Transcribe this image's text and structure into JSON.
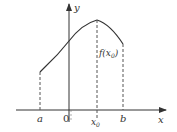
{
  "diagram": {
    "type": "function-graph",
    "axes": {
      "x_label": "x",
      "y_label": "y",
      "origin_label": "0"
    },
    "points": {
      "a_label": "a",
      "b_label": "b",
      "x0_label": "x",
      "x0_subscript": "0",
      "fx0_label": "f(x",
      "fx0_subscript": "0",
      "fx0_close": ")"
    },
    "colors": {
      "curve": "#333333",
      "axes": "#333333",
      "dashed": "#555555",
      "background": "#ffffff"
    }
  }
}
